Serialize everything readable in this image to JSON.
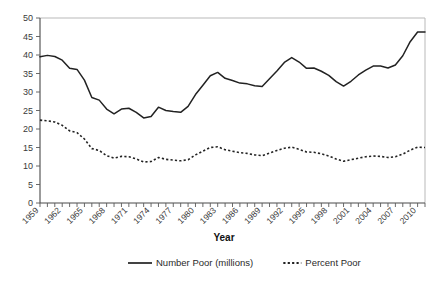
{
  "chart_data": {
    "type": "line",
    "title": "",
    "xlabel": "Year",
    "ylabel": "",
    "xlim": [
      1959,
      2011
    ],
    "ylim": [
      0,
      50
    ],
    "ytick_labels": [
      "0",
      "5",
      "10",
      "15",
      "20",
      "25",
      "30",
      "35",
      "40",
      "45",
      "50"
    ],
    "ytick_values": [
      0,
      5,
      10,
      15,
      20,
      25,
      30,
      35,
      40,
      45,
      50
    ],
    "xtick_labels": [
      "1959",
      "1962",
      "1965",
      "1968",
      "1971",
      "1974",
      "1977",
      "1980",
      "1983",
      "1986",
      "1989",
      "1992",
      "1995",
      "1998",
      "2001",
      "2004",
      "2007",
      "2010"
    ],
    "xtick_values": [
      1959,
      1962,
      1965,
      1968,
      1971,
      1974,
      1977,
      1980,
      1983,
      1986,
      1989,
      1992,
      1995,
      1998,
      2001,
      2004,
      2007,
      2010
    ],
    "grid": false,
    "legend_position": "bottom",
    "x": [
      1959,
      1960,
      1961,
      1962,
      1963,
      1964,
      1965,
      1966,
      1967,
      1968,
      1969,
      1970,
      1971,
      1972,
      1973,
      1974,
      1975,
      1976,
      1977,
      1978,
      1979,
      1980,
      1981,
      1982,
      1983,
      1984,
      1985,
      1986,
      1987,
      1988,
      1989,
      1990,
      1991,
      1992,
      1993,
      1994,
      1995,
      1996,
      1997,
      1998,
      1999,
      2000,
      2001,
      2002,
      2003,
      2004,
      2005,
      2006,
      2007,
      2008,
      2009,
      2010,
      2011
    ],
    "series": [
      {
        "name": "Number Poor (millions)",
        "style": "solid",
        "color": "#222222",
        "values": [
          39.5,
          39.9,
          39.6,
          38.6,
          36.4,
          36.1,
          33.2,
          28.5,
          27.8,
          25.4,
          24.1,
          25.4,
          25.6,
          24.5,
          23.0,
          23.4,
          25.9,
          25.0,
          24.7,
          24.5,
          26.1,
          29.3,
          31.8,
          34.4,
          35.3,
          33.7,
          33.1,
          32.4,
          32.2,
          31.7,
          31.5,
          33.6,
          35.7,
          38.0,
          39.3,
          38.1,
          36.4,
          36.5,
          35.6,
          34.5,
          32.8,
          31.6,
          32.9,
          34.6,
          35.9,
          37.0,
          37.0,
          36.5,
          37.3,
          39.8,
          43.6,
          46.2,
          46.2
        ]
      },
      {
        "name": "Percent Poor",
        "style": "dotted",
        "color": "#222222",
        "values": [
          22.4,
          22.2,
          21.9,
          21.0,
          19.5,
          19.0,
          17.3,
          14.7,
          14.2,
          12.8,
          12.1,
          12.6,
          12.5,
          11.9,
          11.1,
          11.2,
          12.3,
          11.8,
          11.6,
          11.4,
          11.7,
          13.0,
          14.0,
          15.0,
          15.2,
          14.4,
          14.0,
          13.6,
          13.4,
          13.0,
          12.8,
          13.5,
          14.2,
          14.8,
          15.1,
          14.5,
          13.8,
          13.7,
          13.3,
          12.7,
          11.9,
          11.3,
          11.7,
          12.1,
          12.5,
          12.7,
          12.6,
          12.3,
          12.5,
          13.2,
          14.3,
          15.1,
          15.0
        ]
      }
    ]
  },
  "legend": {
    "items": [
      {
        "label": "Number Poor (millions)",
        "marker": "solid-line-swatch"
      },
      {
        "label": "Percent Poor",
        "marker": "dotted-line-swatch"
      }
    ]
  }
}
